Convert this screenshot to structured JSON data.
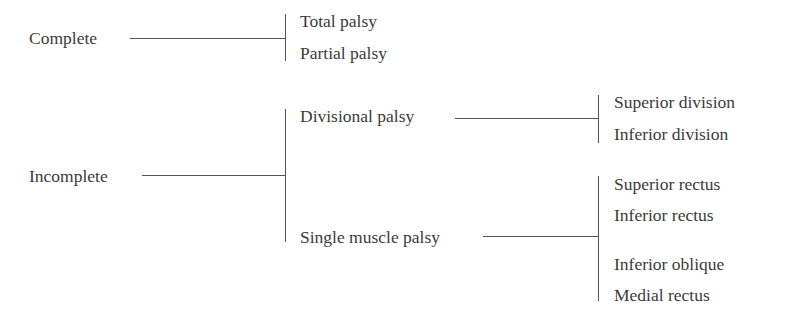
{
  "diagram": {
    "root_nodes": [
      {
        "label": "Complete",
        "children": [
          "Total palsy",
          "Partial palsy"
        ]
      },
      {
        "label": "Incomplete",
        "children": [
          {
            "label": "Divisional palsy",
            "children": [
              "Superior division",
              "Inferior division"
            ]
          },
          {
            "label": "Single muscle palsy",
            "children": [
              "Superior rectus",
              "Inferior rectus",
              "Inferior oblique",
              "Medial rectus"
            ]
          }
        ]
      }
    ]
  },
  "labels": {
    "complete": "Complete",
    "total_palsy": "Total palsy",
    "partial_palsy": "Partial palsy",
    "incomplete": "Incomplete",
    "divisional_palsy": "Divisional palsy",
    "superior_division": "Superior division",
    "inferior_division": "Inferior division",
    "single_muscle_palsy": "Single muscle palsy",
    "superior_rectus": "Superior rectus",
    "inferior_rectus": "Inferior rectus",
    "inferior_oblique": "Inferior oblique",
    "medial_rectus": "Medial rectus"
  }
}
